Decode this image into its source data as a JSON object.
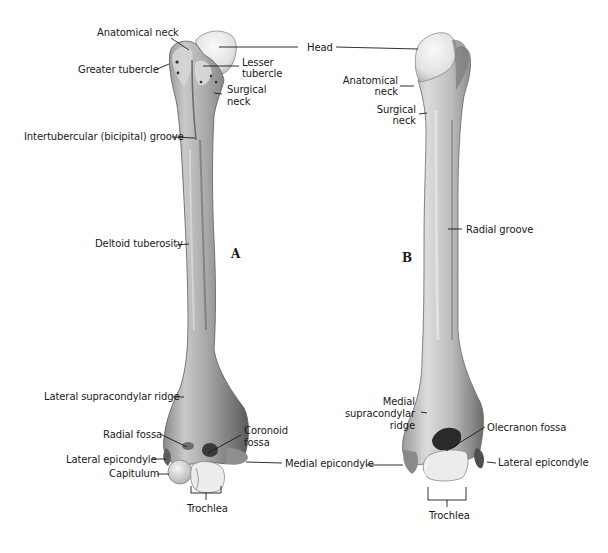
{
  "figure": {
    "panels": [
      {
        "id": "A",
        "label": "A",
        "view": "anterior",
        "labels": {
          "anatomical_neck": "Anatomical neck",
          "greater_tubercle": "Greater tubercle",
          "lesser_tubercle_1": "Lesser",
          "lesser_tubercle_2": "tubercle",
          "surgical_neck_1": "Surgical",
          "surgical_neck_2": "neck",
          "intertubercular_groove": "Intertubercular (bicipital) groove",
          "deltoid_tuberosity": "Deltoid tuberosity",
          "lateral_supracondylar_ridge": "Lateral supracondylar ridge",
          "radial_fossa": "Radial fossa",
          "coronoid_fossa_1": "Coronoid",
          "coronoid_fossa_2": "fossa",
          "lateral_epicondyle": "Lateral epicondyle",
          "capitulum": "Capitulum",
          "trochlea": "Trochlea"
        }
      },
      {
        "id": "B",
        "label": "B",
        "view": "posterior",
        "labels": {
          "anatomical_neck_1": "Anatomical",
          "anatomical_neck_2": "neck",
          "surgical_neck_1": "Surgical",
          "surgical_neck_2": "neck",
          "radial_groove": "Radial groove",
          "medial_supracondylar_ridge_1": "Medial",
          "medial_supracondylar_ridge_2": "supracondylar",
          "medial_supracondylar_ridge_3": "ridge",
          "olecranon_fossa": "Olecranon fossa",
          "lateral_epicondyle": "Lateral epicondyle",
          "trochlea": "Trochlea"
        }
      }
    ],
    "shared_labels": {
      "head": "Head",
      "medial_epicondyle": "Medial epicondyle"
    },
    "colors": {
      "background": "#ffffff",
      "bone_light": "#e8e8e8",
      "bone_mid": "#b5b5b5",
      "bone_dark": "#6e6e6e",
      "cartilage": "#f2f2f2",
      "leader_line": "#1a1a1a",
      "text": "#1a1a1a"
    }
  }
}
